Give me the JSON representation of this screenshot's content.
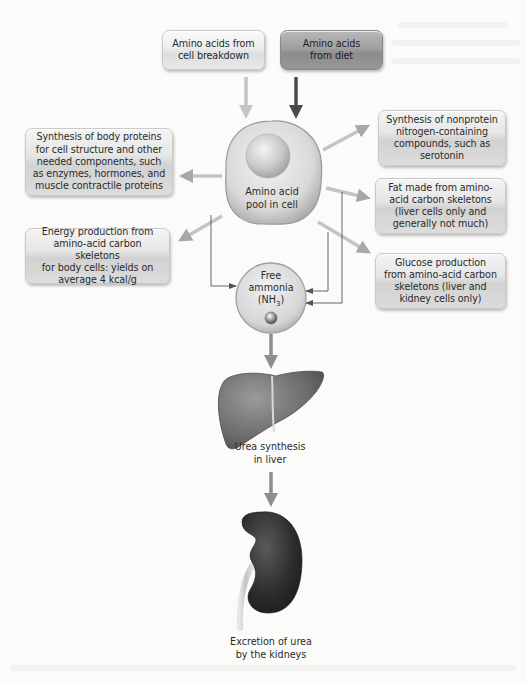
{
  "diagram": {
    "type": "flowchart",
    "topic": "Amino acid metabolism",
    "sources": [
      {
        "id": "cell-breakdown",
        "label": "Amino acids from\ncell breakdown",
        "shade": "light"
      },
      {
        "id": "diet",
        "label": "Amino acids\nfrom diet",
        "shade": "dark"
      }
    ],
    "hub": {
      "label": "Amino acid\npool in cell"
    },
    "outputs_left": [
      {
        "id": "body-proteins",
        "label": "Synthesis of body proteins\nfor cell structure and other\nneeded components, such\nas enzymes, hormones, and\nmuscle contractile proteins"
      },
      {
        "id": "energy",
        "label": "Energy production from\namino-acid carbon skeletons\nfor body cells: yields on\naverage 4 kcal/g"
      }
    ],
    "outputs_right": [
      {
        "id": "nonprotein-nitrogen",
        "label": "Synthesis of nonprotein\nnitrogen-containing\ncompounds, such as\nserotonin"
      },
      {
        "id": "fat",
        "label": "Fat made from amino-\nacid carbon skeletons\n(liver cells only and\ngenerally not much)"
      },
      {
        "id": "glucose",
        "label": "Glucose production\nfrom amino-acid carbon\nskeletons (liver and\nkidney cells only)"
      }
    ],
    "ammonia": {
      "line1": "Free",
      "line2": "ammonia",
      "formula_prefix": "(NH",
      "formula_sub": "3",
      "formula_suffix": ")"
    },
    "liver": {
      "label": "Urea synthesis\nin liver"
    },
    "kidney": {
      "label": "Excretion of urea\nby the kidneys"
    },
    "colors": {
      "arrow_light": "#c4c4c4",
      "arrow_dark": "#4a4a4a",
      "arrow_mid": "#9a9a9a",
      "thin_line": "#555555",
      "liver": "#6e6e6e",
      "kidney": "#333333"
    }
  }
}
